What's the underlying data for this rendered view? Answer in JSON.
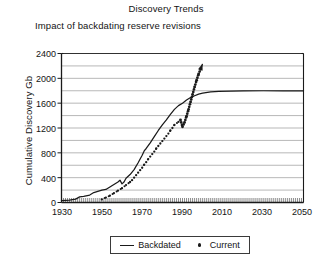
{
  "chart_data": {
    "type": "line",
    "title": "Discovery Trends",
    "subtitle": "Impact of backdating reserve revisions",
    "xlabel": "",
    "ylabel": "Cumulative Discovery Gb",
    "xlim": [
      1930,
      2050
    ],
    "ylim": [
      0,
      2400
    ],
    "xticks": [
      1930,
      1950,
      1970,
      1990,
      2010,
      2030,
      2050
    ],
    "yticks": [
      0,
      400,
      800,
      1200,
      1600,
      2000,
      2400
    ],
    "xtick_labels": [
      "1930",
      "1950",
      "1970",
      "1990",
      "2010",
      "2030",
      "2050"
    ],
    "ytick_labels": [
      "0",
      "400",
      "800",
      "1200",
      "1600",
      "2000",
      "2400"
    ],
    "y_minor_interval": 200,
    "x_minor_interval": 1,
    "grid": "horizontal-minor",
    "legend_position": "below-center",
    "plot_bg": "#ffffff",
    "grid_color": "#9a9a9a",
    "axis_color": "#1a1a1a",
    "series": [
      {
        "name": "Backdated",
        "style": "solid-line",
        "color": "#1a1a1a",
        "points": [
          [
            1930,
            30
          ],
          [
            1934,
            40
          ],
          [
            1937,
            55
          ],
          [
            1939,
            90
          ],
          [
            1941,
            100
          ],
          [
            1944,
            120
          ],
          [
            1946,
            160
          ],
          [
            1948,
            180
          ],
          [
            1950,
            200
          ],
          [
            1952,
            210
          ],
          [
            1954,
            250
          ],
          [
            1956,
            290
          ],
          [
            1958,
            330
          ],
          [
            1959,
            360
          ],
          [
            1960,
            300
          ],
          [
            1961,
            330
          ],
          [
            1962,
            390
          ],
          [
            1964,
            450
          ],
          [
            1966,
            530
          ],
          [
            1968,
            640
          ],
          [
            1970,
            760
          ],
          [
            1971,
            830
          ],
          [
            1972,
            870
          ],
          [
            1974,
            960
          ],
          [
            1976,
            1060
          ],
          [
            1978,
            1160
          ],
          [
            1980,
            1250
          ],
          [
            1982,
            1330
          ],
          [
            1984,
            1420
          ],
          [
            1986,
            1500
          ],
          [
            1988,
            1560
          ],
          [
            1990,
            1600
          ],
          [
            1992,
            1650
          ],
          [
            1994,
            1690
          ],
          [
            1996,
            1720
          ],
          [
            1998,
            1745
          ],
          [
            2000,
            1760
          ],
          [
            2004,
            1780
          ],
          [
            2008,
            1790
          ],
          [
            2014,
            1795
          ],
          [
            2020,
            1798
          ],
          [
            2030,
            1800
          ],
          [
            2040,
            1800
          ],
          [
            2050,
            1800
          ]
        ]
      },
      {
        "name": "Current",
        "style": "dotted",
        "color": "#1a1a1a",
        "arrow_end": true,
        "points": [
          [
            1950,
            50
          ],
          [
            1952,
            80
          ],
          [
            1954,
            110
          ],
          [
            1956,
            150
          ],
          [
            1958,
            190
          ],
          [
            1960,
            230
          ],
          [
            1962,
            280
          ],
          [
            1964,
            330
          ],
          [
            1965,
            360
          ],
          [
            1966,
            400
          ],
          [
            1967,
            440
          ],
          [
            1968,
            480
          ],
          [
            1969,
            520
          ],
          [
            1970,
            560
          ],
          [
            1971,
            610
          ],
          [
            1972,
            650
          ],
          [
            1973,
            700
          ],
          [
            1974,
            740
          ],
          [
            1975,
            780
          ],
          [
            1976,
            820
          ],
          [
            1977,
            870
          ],
          [
            1978,
            910
          ],
          [
            1979,
            950
          ],
          [
            1980,
            990
          ],
          [
            1981,
            1030
          ],
          [
            1982,
            1070
          ],
          [
            1983,
            1110
          ],
          [
            1984,
            1160
          ],
          [
            1985,
            1200
          ],
          [
            1986,
            1250
          ],
          [
            1988,
            1300
          ],
          [
            1989,
            1330
          ],
          [
            1990,
            1220
          ],
          [
            1991,
            1290
          ],
          [
            1992,
            1390
          ],
          [
            1993,
            1500
          ],
          [
            1994,
            1620
          ],
          [
            1995,
            1740
          ],
          [
            1996,
            1860
          ],
          [
            1997,
            1970
          ],
          [
            1998,
            2070
          ],
          [
            1999,
            2150
          ]
        ]
      }
    ]
  },
  "legend": {
    "entries": [
      {
        "label": "Backdated",
        "marker": "line"
      },
      {
        "label": "Current",
        "marker": "dot"
      }
    ]
  }
}
